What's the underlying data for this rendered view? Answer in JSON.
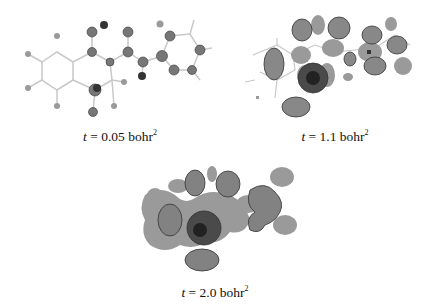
{
  "figure": {
    "panels": [
      {
        "id": "a",
        "t_var": "t",
        "equals": " = ",
        "value": "0.05",
        "unit": "bohr",
        "exp": "2",
        "description": "ball-and-stick molecule with small isosurfaces on atoms"
      },
      {
        "id": "b",
        "t_var": "t",
        "equals": " = ",
        "value": "1.1",
        "unit": "bohr",
        "exp": "2",
        "description": "molecular orbital isosurfaces, mesh and shaded lobes"
      },
      {
        "id": "c",
        "t_var": "t",
        "equals": " = ",
        "value": "2.0",
        "unit": "bohr",
        "exp": "2",
        "description": "larger merged orbital isosurfaces"
      }
    ],
    "colors": {
      "mesh": "#555555",
      "lobe": "#9a9a9a",
      "bond": "#bdbdbd",
      "dark": "#2a2a2a"
    }
  }
}
